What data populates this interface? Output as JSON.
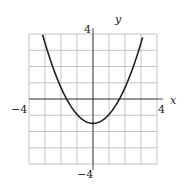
{
  "chart_data": {
    "type": "line",
    "title": "",
    "xlabel": "x",
    "ylabel": "y",
    "xlim": [
      -4,
      4
    ],
    "ylim": [
      -4,
      4
    ],
    "grid": true,
    "grid_step": 1,
    "tick_labels": {
      "x_min": "−4",
      "x_max": "4",
      "y_min": "−4",
      "y_max": "4"
    },
    "series": [
      {
        "name": "parabola",
        "function": "y = 0.55x^2 - 1.5",
        "x": [
          -3.2,
          -3,
          -2.5,
          -2,
          -1.65,
          -1.5,
          -1,
          -0.5,
          0,
          0.5,
          1,
          1.5,
          1.65,
          2,
          2.5,
          3,
          3.1
        ],
        "y": [
          4.0,
          3.45,
          1.94,
          0.7,
          0.0,
          -0.26,
          -0.95,
          -1.36,
          -1.5,
          -1.36,
          -0.95,
          -0.26,
          0.0,
          0.7,
          1.94,
          3.45,
          3.8
        ]
      }
    ],
    "vertex": [
      0,
      -1.5
    ]
  },
  "labels": {
    "x_axis": "x",
    "y_axis": "y",
    "x_min": "−4",
    "x_max": "4",
    "y_min": "−4",
    "y_max": "4"
  },
  "colors": {
    "grid": "#b5b5b5",
    "axis": "#444444",
    "curve": "#222222"
  }
}
